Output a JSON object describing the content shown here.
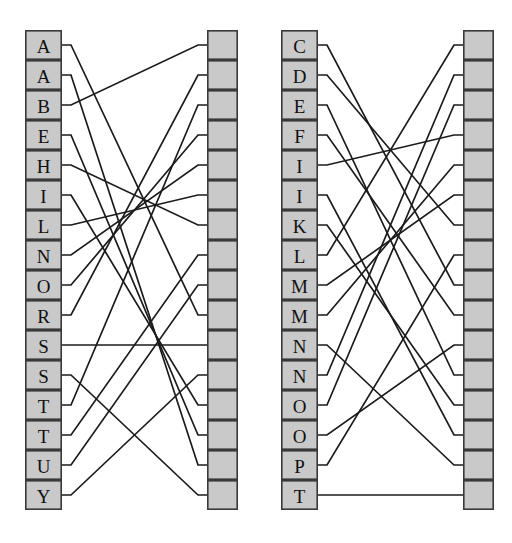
{
  "figure": {
    "background_color": "#ffffff",
    "box_fill": "#c9c9c9",
    "box_stroke": "#3a3a3a",
    "edge_color": "#1b1b1b"
  },
  "panels": [
    {
      "id": "left-panel",
      "name": "left-bipartite-diagram",
      "left_column": {
        "name": "left-labeled-column",
        "x": 25,
        "y": 30,
        "box_width": 37,
        "box_height": 30,
        "count": 16,
        "labels": [
          "A",
          "A",
          "B",
          "E",
          "H",
          "I",
          "L",
          "N",
          "O",
          "R",
          "S",
          "S",
          "T",
          "T",
          "U",
          "Y"
        ]
      },
      "right_column": {
        "name": "left-blank-column",
        "x": 207,
        "y": 30,
        "box_width": 31,
        "box_height": 30,
        "count": 16,
        "labels": [
          "",
          "",
          "",
          "",
          "",
          "",
          "",
          "",
          "",
          "",
          "",
          "",
          "",
          "",
          "",
          ""
        ]
      },
      "edges": [
        {
          "from": 0,
          "to": 9
        },
        {
          "from": 1,
          "to": 14
        },
        {
          "from": 2,
          "to": 0
        },
        {
          "from": 3,
          "to": 13
        },
        {
          "from": 4,
          "to": 6
        },
        {
          "from": 5,
          "to": 12
        },
        {
          "from": 6,
          "to": 5
        },
        {
          "from": 7,
          "to": 4
        },
        {
          "from": 8,
          "to": 3
        },
        {
          "from": 9,
          "to": 1
        },
        {
          "from": 10,
          "to": 10
        },
        {
          "from": 11,
          "to": 15
        },
        {
          "from": 12,
          "to": 2
        },
        {
          "from": 13,
          "to": 7
        },
        {
          "from": 14,
          "to": 8
        },
        {
          "from": 15,
          "to": 11
        }
      ]
    },
    {
      "id": "right-panel",
      "name": "right-bipartite-diagram",
      "left_column": {
        "name": "right-labeled-column",
        "x": 25,
        "y": 30,
        "box_width": 37,
        "box_height": 30,
        "count": 16,
        "labels": [
          "C",
          "D",
          "E",
          "F",
          "I",
          "I",
          "K",
          "L",
          "M",
          "M",
          "N",
          "N",
          "O",
          "O",
          "P",
          "T"
        ]
      },
      "right_column": {
        "name": "right-blank-column",
        "x": 207,
        "y": 30,
        "box_width": 31,
        "box_height": 30,
        "count": 16,
        "labels": [
          "",
          "",
          "",
          "",
          "",
          "",
          "",
          "",
          "",
          "",
          "",
          "",
          "",
          "",
          "",
          ""
        ]
      },
      "edges": [
        {
          "from": 0,
          "to": 8
        },
        {
          "from": 1,
          "to": 6
        },
        {
          "from": 2,
          "to": 11
        },
        {
          "from": 3,
          "to": 9
        },
        {
          "from": 4,
          "to": 3
        },
        {
          "from": 5,
          "to": 13
        },
        {
          "from": 6,
          "to": 12
        },
        {
          "from": 7,
          "to": 0
        },
        {
          "from": 8,
          "to": 5
        },
        {
          "from": 9,
          "to": 4
        },
        {
          "from": 10,
          "to": 14
        },
        {
          "from": 11,
          "to": 1
        },
        {
          "from": 12,
          "to": 2
        },
        {
          "from": 13,
          "to": 10
        },
        {
          "from": 14,
          "to": 7
        },
        {
          "from": 15,
          "to": 15
        }
      ]
    }
  ]
}
